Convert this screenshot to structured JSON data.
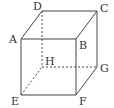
{
  "diagram": {
    "type": "cube",
    "stroke_color": "#444444",
    "background": "#ffffff",
    "vertices": {
      "A": {
        "label": "A",
        "x": 21,
        "y": 39
      },
      "B": {
        "label": "B",
        "x": 76,
        "y": 39
      },
      "C": {
        "label": "C",
        "x": 97,
        "y": 11
      },
      "D": {
        "label": "D",
        "x": 42,
        "y": 11
      },
      "E": {
        "label": "E",
        "x": 21,
        "y": 95
      },
      "F": {
        "label": "F",
        "x": 76,
        "y": 95
      },
      "G": {
        "label": "G",
        "x": 97,
        "y": 67
      },
      "H": {
        "label": "H",
        "x": 42,
        "y": 67
      }
    },
    "edges_solid": [
      "AB",
      "BC",
      "CD",
      "DA",
      "AE",
      "BF",
      "CG",
      "EF",
      "FG"
    ],
    "edges_hidden": [
      "DH",
      "EH",
      "HG"
    ],
    "labels": {
      "A": "A",
      "B": "B",
      "C": "C",
      "D": "D",
      "E": "E",
      "F": "F",
      "G": "G",
      "H": "H"
    }
  }
}
